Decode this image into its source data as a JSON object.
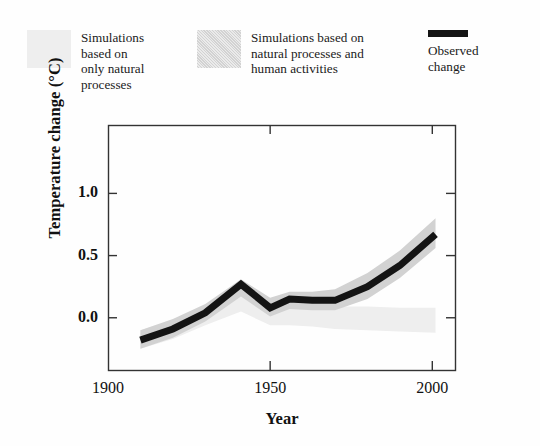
{
  "legend": {
    "items": [
      {
        "key": "natural-only",
        "swatch": "light-gray-band-swatch",
        "label": "Simulations\nbased on\nonly natural\nprocesses",
        "color": "#eeeeee"
      },
      {
        "key": "natural-and-human",
        "swatch": "medium-gray-band-swatch",
        "label": "Simulations based on\nnatural processes and\nhuman activities",
        "color": "#d2d2d2"
      },
      {
        "key": "observed",
        "swatch": "black-line-swatch",
        "label": "Observed\nchange",
        "color": "#141414"
      }
    ]
  },
  "chart_data": {
    "type": "line",
    "title": "",
    "xlabel": "Year",
    "ylabel": "Temperature change (°C)",
    "xlim": [
      1900,
      2007
    ],
    "ylim": [
      -0.42,
      1.55
    ],
    "xticks": [
      1900,
      1950,
      2000
    ],
    "xticklabels": [
      "1900",
      "1950",
      "2000"
    ],
    "yticks": [
      0.0,
      0.5,
      1.0
    ],
    "yticklabels": [
      "0.0",
      "0.5",
      "1.0"
    ],
    "grid": false,
    "legend_position": "above-plot",
    "series": [
      {
        "name": "Observed change",
        "type": "line",
        "color": "#141414",
        "linewidth": 7,
        "x": [
          1910,
          1920,
          1930,
          1941,
          1950,
          1956,
          1963,
          1970,
          1980,
          1990,
          2001
        ],
        "values": [
          -0.18,
          -0.09,
          0.04,
          0.27,
          0.08,
          0.15,
          0.14,
          0.14,
          0.25,
          0.42,
          0.67
        ]
      },
      {
        "name": "Simulations based on natural processes and human activities",
        "type": "band",
        "color": "#d2d2d2",
        "x": [
          1910,
          1920,
          1930,
          1941,
          1950,
          1956,
          1963,
          1970,
          1980,
          1990,
          2001
        ],
        "upper": [
          -0.1,
          -0.01,
          0.11,
          0.31,
          0.16,
          0.21,
          0.21,
          0.23,
          0.36,
          0.54,
          0.8
        ],
        "lower": [
          -0.25,
          -0.16,
          -0.03,
          0.17,
          0.01,
          0.07,
          0.06,
          0.06,
          0.15,
          0.32,
          0.56
        ]
      },
      {
        "name": "Simulations based on only natural processes",
        "type": "band",
        "color": "#eeeeee",
        "x": [
          1910,
          1920,
          1930,
          1941,
          1950,
          1956,
          1963,
          1970,
          1980,
          1990,
          2001
        ],
        "upper": [
          -0.1,
          -0.02,
          0.09,
          0.22,
          0.1,
          0.11,
          0.1,
          0.09,
          0.09,
          0.08,
          0.08
        ],
        "lower": [
          -0.25,
          -0.17,
          -0.06,
          0.05,
          -0.06,
          -0.06,
          -0.07,
          -0.09,
          -0.1,
          -0.11,
          -0.12
        ]
      }
    ]
  }
}
